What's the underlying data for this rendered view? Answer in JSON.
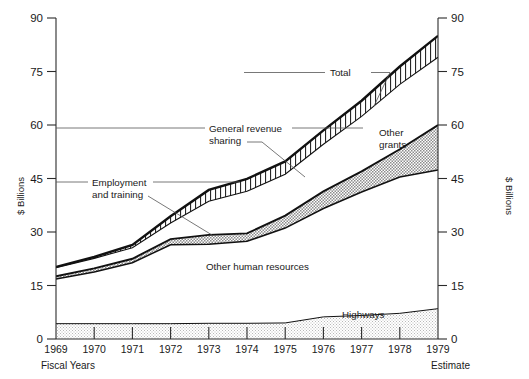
{
  "axes": {
    "left_title": "$ Billions",
    "right_title": "$ Billions",
    "y_ticks": [
      "0",
      "15",
      "30",
      "45",
      "60",
      "75",
      "90"
    ],
    "x_label_left": "Fiscal Years",
    "x_label_right": "Estimate",
    "years": [
      "1969",
      "1970",
      "1971",
      "1972",
      "1973",
      "1974",
      "1975",
      "1976",
      "1977",
      "1978",
      "1979"
    ]
  },
  "annotations": {
    "total": "Total",
    "general_revenue_sharing_l1": "General revenue",
    "general_revenue_sharing_l2": "sharing",
    "employment_l1": "Employment",
    "employment_l2": "and training",
    "other_grants_l1": "Other",
    "other_grants_l2": "grants",
    "other_human_resources": "Other human resources",
    "highways": "Highways"
  },
  "colors": {
    "ink": "#111111",
    "axis": "#2b2b2b",
    "leader": "#555555",
    "hatch_vertical": "#111111",
    "stipple_dark": "#9a9a9a",
    "stipple_light": "#cfcfcf",
    "paper": "#ffffff"
  },
  "chart_data": {
    "type": "area",
    "title": "",
    "subtitle": "",
    "xlabel": "Fiscal Years",
    "ylabel": "$ Billions",
    "ylim": [
      0,
      90
    ],
    "xlim": [
      "1969",
      "1979"
    ],
    "ytick_step": 15,
    "grid": false,
    "legend": "inline-annotations",
    "x": [
      "1969",
      "1970",
      "1971",
      "1972",
      "1973",
      "1974",
      "1975",
      "1976",
      "1977",
      "1978",
      "1979"
    ],
    "series": [
      {
        "name": "Total",
        "role": "top boundary of stack (cumulative outlays)",
        "values": [
          20.2,
          23.0,
          26.4,
          34.4,
          41.8,
          44.9,
          49.8,
          58.5,
          66.8,
          76.4,
          85.0
        ]
      },
      {
        "name": "General revenue sharing",
        "role": "band between Total and the lower general-revenue-sharing boundary",
        "lower_values": [
          20.0,
          22.6,
          25.6,
          32.5,
          38.6,
          41.4,
          46.2,
          54.6,
          62.4,
          71.4,
          79.0
        ],
        "band_values": [
          0.2,
          0.4,
          0.8,
          1.9,
          3.2,
          3.5,
          3.6,
          3.9,
          4.4,
          5.0,
          6.0
        ]
      },
      {
        "name": "Other grants",
        "role": "band between general revenue sharing lower edge and other human resources top",
        "lower_values": [
          17.6,
          19.8,
          22.5,
          28.0,
          29.2,
          29.6,
          34.6,
          41.4,
          47.0,
          53.2,
          60.0
        ],
        "band_values": [
          2.4,
          2.8,
          3.1,
          4.5,
          9.4,
          11.8,
          11.6,
          13.2,
          15.4,
          18.2,
          19.0
        ]
      },
      {
        "name": "Employment and training",
        "role": "thin stippled band just under the other-human-resources top boundary",
        "lower_values": [
          16.8,
          18.8,
          21.4,
          26.4,
          26.6,
          27.4,
          31.1,
          36.6,
          41.2,
          45.4,
          47.4
        ],
        "band_values": [
          0.8,
          1.0,
          1.1,
          1.6,
          2.6,
          2.2,
          3.5,
          4.8,
          5.8,
          7.8,
          12.6
        ]
      },
      {
        "name": "Other human resources",
        "role": "large unshaded region below employment and training band",
        "upper_values": [
          16.8,
          18.8,
          21.4,
          26.4,
          26.6,
          27.4,
          31.1,
          36.6,
          41.2,
          45.4,
          47.4
        ]
      },
      {
        "name": "Highways",
        "role": "bottom stippled band measured from zero",
        "values": [
          4.3,
          4.3,
          4.3,
          4.3,
          4.4,
          4.4,
          4.5,
          6.2,
          6.6,
          7.2,
          8.5
        ]
      }
    ]
  }
}
